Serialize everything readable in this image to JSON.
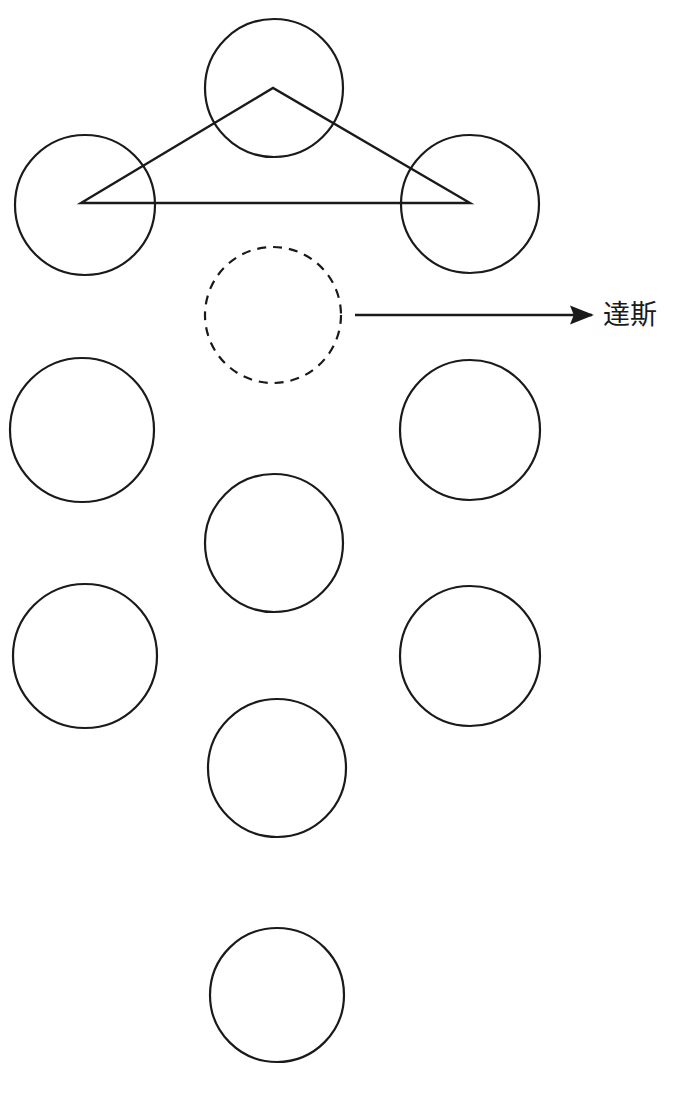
{
  "canvas": {
    "width": 679,
    "height": 1099,
    "background_color": "#ffffff",
    "stroke_color": "#1a1a1a"
  },
  "diagram": {
    "title_text": "",
    "kind": "circle-lattice-with-triangle-and-arrow",
    "stroke_width_circle": 2.2,
    "stroke_width_triangle": 2.4,
    "stroke_width_arrow": 2.4,
    "dash_pattern": "9 7"
  },
  "circles": [
    {
      "name": "circle-top-left",
      "cx": 85,
      "cy": 205,
      "r": 70,
      "style": "solid",
      "row": 1,
      "col": "left"
    },
    {
      "name": "circle-top-middle",
      "cx": 274,
      "cy": 88,
      "r": 69,
      "style": "solid",
      "row": 0,
      "col": "middle"
    },
    {
      "name": "circle-top-right",
      "cx": 470,
      "cy": 204,
      "r": 69,
      "style": "solid",
      "row": 1,
      "col": "right"
    },
    {
      "name": "circle-dashed-middle",
      "cx": 273,
      "cy": 315,
      "r": 68,
      "style": "dashed",
      "row": 2,
      "col": "middle"
    },
    {
      "name": "circle-row3-left",
      "cx": 82,
      "cy": 430,
      "r": 72,
      "style": "solid",
      "row": 3,
      "col": "left"
    },
    {
      "name": "circle-row3-right",
      "cx": 470,
      "cy": 430,
      "r": 70,
      "style": "solid",
      "row": 3,
      "col": "right"
    },
    {
      "name": "circle-row4-middle",
      "cx": 274,
      "cy": 543,
      "r": 69,
      "style": "solid",
      "row": 4,
      "col": "middle"
    },
    {
      "name": "circle-row5-left",
      "cx": 85,
      "cy": 656,
      "r": 72,
      "style": "solid",
      "row": 5,
      "col": "left"
    },
    {
      "name": "circle-row5-right",
      "cx": 470,
      "cy": 656,
      "r": 70,
      "style": "solid",
      "row": 5,
      "col": "right"
    },
    {
      "name": "circle-row6-middle",
      "cx": 277,
      "cy": 768,
      "r": 69,
      "style": "solid",
      "row": 6,
      "col": "middle"
    },
    {
      "name": "circle-bottom-middle",
      "cx": 277,
      "cy": 995,
      "r": 67,
      "style": "solid",
      "row": 7,
      "col": "middle"
    }
  ],
  "triangle": {
    "name": "connector-triangle",
    "points": "81,203 273,88 470,203",
    "vertices": [
      {
        "label": "",
        "x": 81,
        "y": 203
      },
      {
        "label": "",
        "x": 273,
        "y": 88
      },
      {
        "label": "",
        "x": 470,
        "y": 203
      }
    ]
  },
  "arrow": {
    "name": "pointer-arrow",
    "x1": 355,
    "y1": 315,
    "x2": 592,
    "y2": 315,
    "head_length": 18,
    "head_width": 14
  },
  "annotation": {
    "label": "達斯",
    "x": 603,
    "y": 315,
    "font_size": 27,
    "color": "#1a1a1a"
  }
}
